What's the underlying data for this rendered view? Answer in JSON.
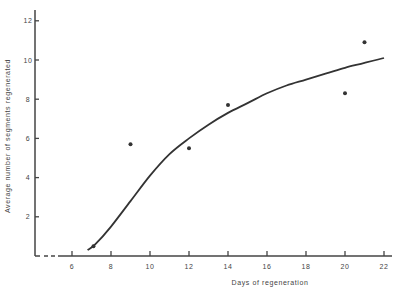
{
  "chart_data": {
    "type": "scatter",
    "title": "",
    "xlabel": "Days of regeneration",
    "ylabel": "Average number of segments regenerated",
    "xlim": [
      4,
      22
    ],
    "ylim": [
      0,
      12.5
    ],
    "x_ticks": [
      6,
      8,
      10,
      12,
      14,
      16,
      18,
      20,
      22
    ],
    "y_ticks": [
      2,
      4,
      6,
      8,
      10,
      12
    ],
    "grid": false,
    "legend": null,
    "series": [
      {
        "name": "observed",
        "kind": "points",
        "x": [
          7.1,
          9,
          12,
          14,
          20,
          21
        ],
        "y": [
          0.5,
          5.7,
          5.5,
          7.7,
          8.3,
          10.9
        ]
      },
      {
        "name": "fitted curve",
        "kind": "line",
        "x": [
          6.8,
          7.2,
          8,
          9,
          10,
          11,
          12,
          13,
          14,
          15,
          16,
          17,
          18,
          19,
          20,
          21,
          22
        ],
        "y": [
          0.3,
          0.6,
          1.5,
          2.8,
          4.1,
          5.2,
          6.0,
          6.7,
          7.3,
          7.8,
          8.3,
          8.7,
          9.0,
          9.3,
          9.6,
          9.85,
          10.1
        ]
      }
    ],
    "annotations": [
      "dashed x-axis segment between x=4 and x=5.5"
    ]
  }
}
